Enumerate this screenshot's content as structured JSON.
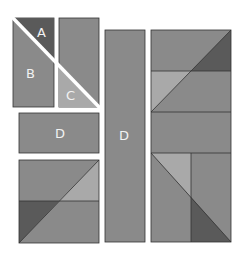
{
  "colors": {
    "background": "#ffffff",
    "medium": "#8a8a8a",
    "dark": "#5a5a5a",
    "light": "#a9a9a9",
    "line": "#333333",
    "separator": "#ffffff",
    "label": "#f2f2f2"
  },
  "pieces": [
    {
      "id": "A",
      "label": "A",
      "shade": "dark",
      "shape": "triangle"
    },
    {
      "id": "B",
      "label": "B",
      "shade": "medium",
      "shape": "trapezoid"
    },
    {
      "id": "C",
      "label": "C",
      "shade": "light",
      "shape": "triangle"
    },
    {
      "id": "D1",
      "label": "D",
      "shade": "medium",
      "shape": "horizontal-rectangle"
    },
    {
      "id": "D2",
      "label": "D",
      "shade": "medium",
      "shape": "vertical-rectangle"
    }
  ],
  "labels": {
    "a": "A",
    "b": "B",
    "c": "C",
    "d_horizontal": "D",
    "d_vertical": "D"
  }
}
